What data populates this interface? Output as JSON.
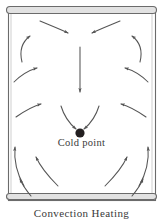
{
  "figure": {
    "caption": "Convection Heating",
    "cold_point_label": "Cold point",
    "colors": {
      "container_stroke": "#6b6b6b",
      "container_fill": "#ffffff",
      "rim_fill": "#e2e2e2",
      "arrow_stroke": "#555555",
      "cold_point_fill": "#231f20",
      "background": "#ffffff",
      "text": "#3a3a3a"
    },
    "container": {
      "x": 8,
      "y": 8,
      "width": 147,
      "height": 192,
      "top_rim_height": 7,
      "bottom_rim_height": 6
    },
    "cold_point": {
      "cx": 80,
      "cy": 133,
      "r": 4.6
    },
    "flow_arrows": [
      {
        "name": "top-left-inward",
        "d": "M 40,21 C 52,26 62,30 68,33",
        "dir": "down-right"
      },
      {
        "name": "top-right-inward",
        "d": "M 120,21 C 108,26 98,30 92,33",
        "dir": "down-left"
      },
      {
        "name": "center-down",
        "d": "M 80,47 L 80,92",
        "dir": "down"
      },
      {
        "name": "upper-left-wall-up",
        "d": "M 22,62 C 19,50 22,42 30,36",
        "dir": "up-right"
      },
      {
        "name": "upper-right-wall-up",
        "d": "M 140,62 C 143,50 140,42 132,36",
        "dir": "up-left"
      },
      {
        "name": "mid-left-outward",
        "d": "M 14,82 C 22,74 30,70 37,68",
        "dir": "up-right"
      },
      {
        "name": "mid-right-outward",
        "d": "M 148,82 C 140,74 132,70 125,68",
        "dir": "up-left"
      },
      {
        "name": "mid-left-inward",
        "d": "M 16,117 C 26,110 34,106 41,104",
        "dir": "up-right"
      },
      {
        "name": "mid-right-inward",
        "d": "M 146,117 C 136,110 128,106 121,104",
        "dir": "up-left"
      },
      {
        "name": "converge-left",
        "d": "M 61,106 C 64,116 70,124 76,129",
        "dir": "down-right"
      },
      {
        "name": "converge-right",
        "d": "M 99,106 C 96,116 90,124 84,129",
        "dir": "down-left"
      },
      {
        "name": "lower-left-wall-up",
        "d": "M 24,186 C 16,172 14,158 15,147",
        "dir": "up"
      },
      {
        "name": "lower-right-wall-up",
        "d": "M 139,186 C 147,172 149,158 148,147",
        "dir": "up"
      },
      {
        "name": "lower-left-diag",
        "d": "M 58,186 C 48,176 40,166 36,157",
        "dir": "up-left"
      },
      {
        "name": "lower-right-diag",
        "d": "M 105,186 C 115,176 123,166 127,157",
        "dir": "up-right"
      },
      {
        "name": "bottom-left-diag",
        "d": "M 31,196 C 26,190 22,184 20,179",
        "dir": "up-left"
      },
      {
        "name": "bottom-right-diag",
        "d": "M 132,196 C 137,190 141,184 143,179",
        "dir": "up-right"
      }
    ]
  }
}
